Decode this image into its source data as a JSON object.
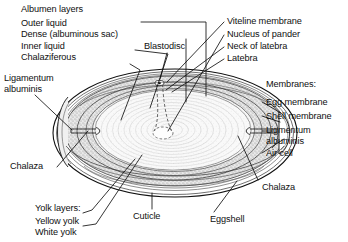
{
  "figure": {
    "background_color": "#ffffff",
    "ink_color": "#101010",
    "shell_fill": "#ffffff",
    "albumen_fill": "#e8e8e8",
    "stipple_fill": "#d8d8d8",
    "yolk_fill": "#f2f2f2",
    "width": 348,
    "height": 242
  },
  "labels": {
    "albumen_heading": "Albumen layers",
    "outer_liquid": "Outer liquid",
    "dense_sac": "Dense (albuminous sac)",
    "inner_liquid": "Inner liquid",
    "chalaziferous": "Chalaziferous",
    "ligamentum_albuminis_left": "Ligamentum\nalbuminis",
    "chalaza_left": "Chalaza",
    "yolk_heading": "Yolk layers:",
    "yellow_yolk": "Yellow yolk",
    "white_yolk": "White yolk",
    "cuticle": "Cuticle",
    "eggshell": "Eggshell",
    "blastodisc": "Blastodisc",
    "viteline_membrane": "Viteline membrane",
    "nucleus_of_pander": "Nucleus of pander",
    "neck_of_latebra": "Neck of latebra",
    "latebra": "Latebra",
    "membranes_heading": "Membranes:",
    "egg_membrane": "Egg membrane",
    "shell_membrane": "Shell membrane",
    "ligamentum_albuminis_right": "Ligmentum\nalbuminis",
    "air_cell": "Air  cell",
    "chalaza_right": "Chalaza"
  }
}
